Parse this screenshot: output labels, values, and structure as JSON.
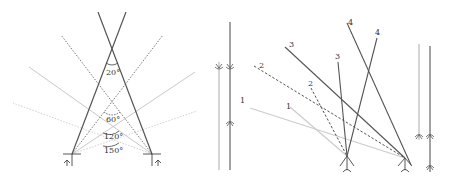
{
  "diagram": {
    "panel_left": {
      "description": "Two receivers with paired rays at different crossing angles",
      "angle_labels": [
        "20°",
        "60°",
        "120°",
        "150°"
      ],
      "colors": {
        "dark": "#555555",
        "dark_dotted": "#777777",
        "light": "#c8c8c8",
        "lighter_dotted": "#d4d4d4"
      }
    },
    "panel_middle": {
      "description": "Two parallel vertical rays with direction arrows",
      "colors": {
        "light": "#aaaaaa",
        "dark": "#666666"
      }
    },
    "panel_right": {
      "description": "Ray pairs numbered 1-4 converging at two receivers, plus parallel vertical reference rays",
      "ray_labels": [
        "1",
        "1",
        "2",
        "2",
        "3",
        "3",
        "4",
        "4"
      ],
      "colors": {
        "ray1": "#cccccc",
        "ray2": "#555555",
        "ray3": "#555555",
        "ray4": "#555555"
      }
    }
  }
}
